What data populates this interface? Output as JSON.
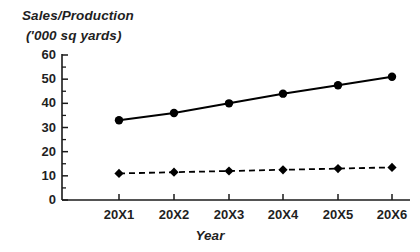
{
  "chart_data": {
    "type": "line",
    "title": "",
    "ylabel_lines": [
      "Sales/Production",
      "('000 sq yards)"
    ],
    "ylabel": "Sales/Production ('000 sq yards)",
    "xlabel": "Year",
    "categories": [
      "20X1",
      "20X2",
      "20X3",
      "20X4",
      "20X5",
      "20X6"
    ],
    "ylim": [
      0,
      60
    ],
    "ytick_labels": [
      "0",
      "10",
      "20",
      "30",
      "40",
      "50",
      "60"
    ],
    "ytick_values": [
      0,
      10,
      20,
      30,
      40,
      50,
      60
    ],
    "yminor_step": 5,
    "grid": false,
    "legend": "none",
    "series": [
      {
        "name": "Sales",
        "style": "solid",
        "marker": "circle",
        "color": "#000000",
        "values": [
          33,
          36,
          40,
          44,
          47.5,
          51
        ]
      },
      {
        "name": "Production",
        "style": "dashed",
        "marker": "diamond",
        "color": "#000000",
        "values": [
          11,
          11.5,
          12,
          12.5,
          13,
          13.5
        ]
      }
    ]
  },
  "geometry": {
    "plot_left": 62,
    "plot_right": 410,
    "plot_top": 55,
    "plot_bottom": 200,
    "x_positions": [
      119,
      174,
      229,
      283,
      338,
      392
    ],
    "y_for_0": 200,
    "y_for_60": 55
  }
}
